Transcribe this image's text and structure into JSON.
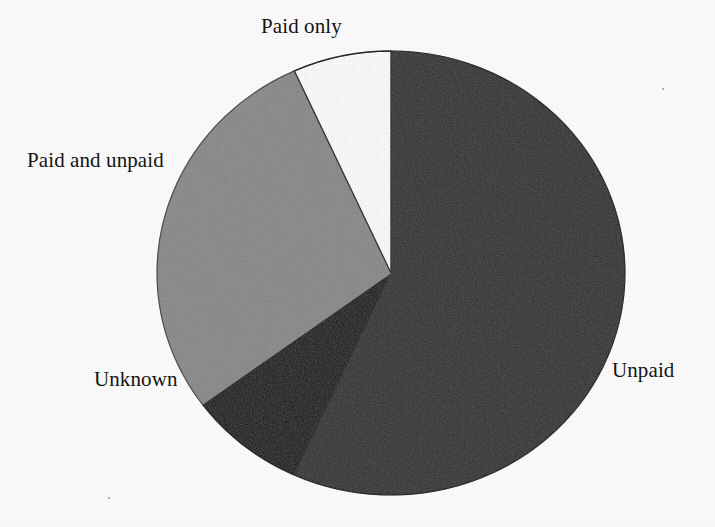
{
  "chart_data": {
    "type": "pie",
    "title": "",
    "subtitle": "",
    "xlabel": "",
    "ylabel": "",
    "legend_position": "none",
    "grid": false,
    "labels_placement": "outside-leader-less",
    "start_angle_deg": 0,
    "direction": "counterclockwise",
    "categories": [
      "Paid only",
      "Paid and unpaid",
      "Unknown",
      "Unpaid"
    ],
    "values": [
      6.8,
      28.3,
      8.1,
      56.8
    ],
    "units": "percent",
    "slices": [
      {
        "label": "Paid only",
        "value": 6.8,
        "start_angle_deg": 0,
        "end_angle_deg": 24.4,
        "color": "#ffffff",
        "stroke": "#1a1a1a",
        "swatch_name": "white"
      },
      {
        "label": "Paid and unpaid",
        "value": 28.3,
        "start_angle_deg": 24.4,
        "end_angle_deg": 126.3,
        "color": "#8b8b8b",
        "stroke": "#8b8b8b",
        "swatch_name": "light-gray"
      },
      {
        "label": "Unknown",
        "value": 8.1,
        "start_angle_deg": 126.3,
        "end_angle_deg": 155.4,
        "color": "#0b0b0b",
        "stroke": "#0b0b0b",
        "swatch_name": "black"
      },
      {
        "label": "Unpaid",
        "value": 56.8,
        "start_angle_deg": 155.4,
        "end_angle_deg": 360,
        "color": "#2e2e2e",
        "stroke": "#2e2e2e",
        "swatch_name": "dark-gray"
      }
    ],
    "geometry": {
      "center_x": 391,
      "center_y": 273,
      "radius_x": 234,
      "radius_y": 222
    }
  },
  "labels": {
    "paid_only": "Paid only",
    "paid_and_unpaid": "Paid and unpaid",
    "unknown": "Unknown",
    "unpaid": "Unpaid"
  },
  "colors": {
    "white_slice": "#ffffff",
    "light_gray_slice": "#8b8b8b",
    "black_slice": "#0b0b0b",
    "dark_gray_slice": "#2e2e2e",
    "outline": "#1a1a1a",
    "text": "#141414",
    "background": "#ffffff"
  }
}
